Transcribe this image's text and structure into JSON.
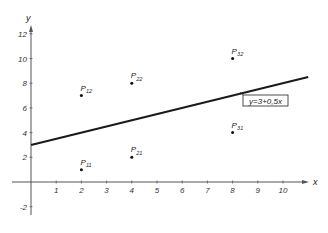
{
  "chart_data": {
    "type": "scatter",
    "title": "",
    "xlabel": "x",
    "ylabel": "y",
    "xlim": [
      -1,
      11
    ],
    "ylim": [
      -3,
      12.5
    ],
    "grid": false,
    "x_ticks": [
      1,
      2,
      3,
      4,
      5,
      6,
      7,
      8,
      9,
      10
    ],
    "y_ticks": [
      -2,
      2,
      4,
      6,
      8,
      10,
      12
    ],
    "points": [
      {
        "name": "P",
        "sub": "11",
        "x": 2,
        "y": 1
      },
      {
        "name": "P",
        "sub": "12",
        "x": 2,
        "y": 7
      },
      {
        "name": "P",
        "sub": "21",
        "x": 4,
        "y": 2
      },
      {
        "name": "P",
        "sub": "22",
        "x": 4,
        "y": 8
      },
      {
        "name": "P",
        "sub": "31",
        "x": 8,
        "y": 4
      },
      {
        "name": "P",
        "sub": "32",
        "x": 8,
        "y": 10
      }
    ],
    "regression_line": {
      "intercept": 3,
      "slope": 0.5,
      "x_start": 0,
      "x_end": 11,
      "label": "y = 3 + 0,5x"
    }
  },
  "colors": {
    "axis": "#555555",
    "line": "#1a1a1a",
    "point": "#111111",
    "text": "#222222"
  }
}
